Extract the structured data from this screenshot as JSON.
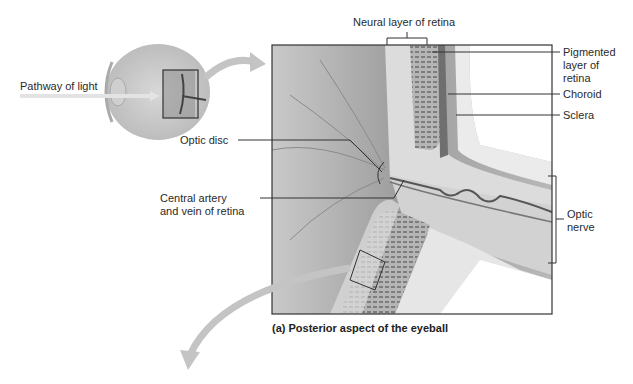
{
  "figure": {
    "caption": "(a) Posterior aspect of the eyeball",
    "inset_label": "Pathway of light"
  },
  "labels": {
    "neural_layer": "Neural layer of retina",
    "pigmented_layer": [
      "Pigmented",
      "layer of",
      "retina"
    ],
    "choroid": "Choroid",
    "sclera": "Sclera",
    "optic_nerve": [
      "Optic",
      "nerve"
    ],
    "optic_disc": "Optic disc",
    "central_artery": [
      "Central artery",
      "and vein of retina"
    ]
  },
  "colors": {
    "line": "#333333",
    "arrow_gray": "#bdbdbd",
    "retina_bg": "#a8a8a8",
    "sclera": "#e6e6e6",
    "pigment": "#7a7a7a"
  }
}
